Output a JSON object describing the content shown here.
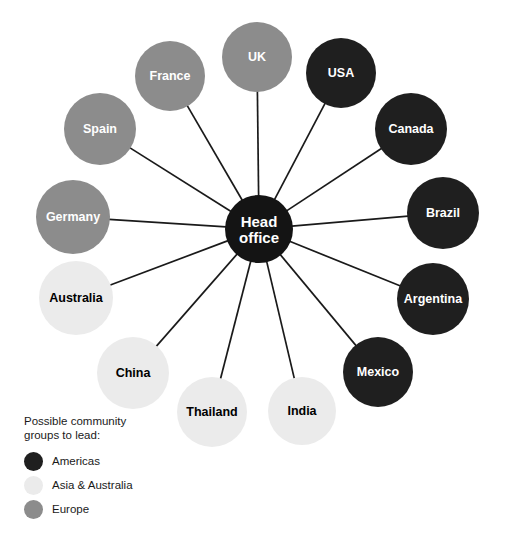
{
  "diagram": {
    "type": "hub-and-spoke",
    "background": "#ffffff",
    "hub": {
      "label_line1": "Head",
      "label_line2": "office",
      "cx": 259,
      "cy": 229,
      "r": 34,
      "fill": "#141414",
      "text_color": "#ffffff"
    },
    "spoke_color": "#1a1a1a",
    "group_colors": {
      "americas": "#1f1f1f",
      "asia_australia": "#ebebeb",
      "europe": "#8c8c8c"
    },
    "label_colors": {
      "americas": "#ffffff",
      "asia_australia": "#000000",
      "europe": "#ffffff"
    },
    "nodes": [
      {
        "label": "UK",
        "group": "europe",
        "cx": 257,
        "cy": 57,
        "r": 35,
        "font_size": 12.5
      },
      {
        "label": "USA",
        "group": "americas",
        "cx": 341,
        "cy": 73,
        "r": 35,
        "font_size": 12.5
      },
      {
        "label": "Canada",
        "group": "americas",
        "cx": 411,
        "cy": 129,
        "r": 36,
        "font_size": 12.5
      },
      {
        "label": "Brazil",
        "group": "americas",
        "cx": 443,
        "cy": 213,
        "r": 36,
        "font_size": 12.5
      },
      {
        "label": "Argentina",
        "group": "americas",
        "cx": 433,
        "cy": 299,
        "r": 36,
        "font_size": 12.5
      },
      {
        "label": "Mexico",
        "group": "americas",
        "cx": 378,
        "cy": 372,
        "r": 35,
        "font_size": 12.5
      },
      {
        "label": "India",
        "group": "asia_australia",
        "cx": 302,
        "cy": 411,
        "r": 34,
        "font_size": 12.5
      },
      {
        "label": "Thailand",
        "group": "asia_australia",
        "cx": 212,
        "cy": 412,
        "r": 35,
        "font_size": 12.5
      },
      {
        "label": "China",
        "group": "asia_australia",
        "cx": 133,
        "cy": 373,
        "r": 36,
        "font_size": 12.5
      },
      {
        "label": "Australia",
        "group": "asia_australia",
        "cx": 76,
        "cy": 298,
        "r": 37,
        "font_size": 12.5
      },
      {
        "label": "Germany",
        "group": "europe",
        "cx": 73,
        "cy": 217,
        "r": 37,
        "font_size": 12.5
      },
      {
        "label": "Spain",
        "group": "europe",
        "cx": 100,
        "cy": 129,
        "r": 36,
        "font_size": 12.5
      },
      {
        "label": "France",
        "group": "europe",
        "cx": 170,
        "cy": 76,
        "r": 35,
        "font_size": 12.5
      }
    ]
  },
  "legend": {
    "title_line1": "Possible community",
    "title_line2": "groups to lead:",
    "items": [
      {
        "label": "Americas",
        "color": "#1f1f1f"
      },
      {
        "label": "Asia & Australia",
        "color": "#ebebeb"
      },
      {
        "label": "Europe",
        "color": "#8c8c8c"
      }
    ]
  }
}
